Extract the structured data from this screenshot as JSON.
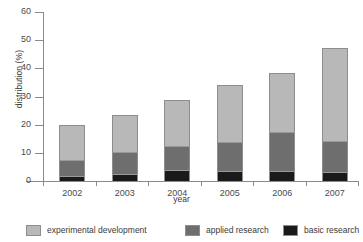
{
  "chart_data": {
    "type": "bar",
    "subtype": "stacked-bar",
    "title": "",
    "xlabel": "year",
    "ylabel": "distribution (%)",
    "categories": [
      "2002",
      "2003",
      "2004",
      "2005",
      "2006",
      "2007"
    ],
    "ylim": [
      0,
      60
    ],
    "yticks": [
      0,
      10,
      20,
      30,
      40,
      50,
      60
    ],
    "ytick_labels": [
      "0",
      "10",
      "20",
      "30",
      "40",
      "50",
      "60"
    ],
    "grid": false,
    "legend_position": "bottom",
    "stack_order_bottom_to_top": [
      "basic research",
      "applied research",
      "experimental development"
    ],
    "series": [
      {
        "name": "basic research",
        "color": "#1a1a1a",
        "values": [
          1.8,
          2.5,
          3.9,
          3.5,
          3.5,
          3.2
        ]
      },
      {
        "name": "applied research",
        "color": "#6e6e6e",
        "values": [
          5.7,
          7.8,
          8.5,
          10.3,
          13.9,
          11.0
        ]
      },
      {
        "name": "experimental development",
        "color": "#b8b8b8",
        "values": [
          12.4,
          13.1,
          16.3,
          20.2,
          20.9,
          33.0
        ]
      }
    ],
    "cumulative_tops": {
      "basic research": [
        1.8,
        2.5,
        3.9,
        3.5,
        3.5,
        3.2
      ],
      "applied research": [
        7.5,
        10.3,
        12.4,
        13.8,
        17.4,
        14.2
      ],
      "experimental development": [
        19.9,
        23.4,
        28.7,
        34.0,
        38.3,
        47.2
      ]
    },
    "totals": [
      19.9,
      23.4,
      28.7,
      34.0,
      38.3,
      47.2
    ]
  },
  "legend": {
    "items": [
      {
        "label": "experimental development",
        "color": "#b8b8b8"
      },
      {
        "label": "applied research",
        "color": "#6e6e6e"
      },
      {
        "label": "basic research",
        "color": "#1a1a1a"
      }
    ]
  }
}
